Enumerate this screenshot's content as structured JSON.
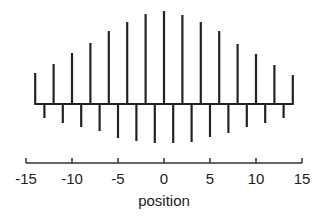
{
  "chart_data": {
    "type": "bar",
    "title": "",
    "xlabel": "position",
    "ylabel": "",
    "xlim": [
      -15,
      15
    ],
    "xticks": [
      -15,
      -10,
      -5,
      0,
      5,
      10,
      15
    ],
    "xtick_labels": [
      "-15",
      "-10",
      "-5",
      "0",
      "5",
      "10",
      "15"
    ],
    "grid": false,
    "series": [
      {
        "name": "upward",
        "x": [
          -14,
          -12,
          -10,
          -8,
          -6,
          -4,
          -2,
          0,
          2,
          4,
          6,
          8,
          10,
          12,
          14
        ],
        "values": [
          31,
          40,
          51,
          61,
          73,
          82,
          90,
          93,
          89,
          82,
          73,
          60,
          50,
          39,
          29
        ]
      },
      {
        "name": "downward",
        "x": [
          -13,
          -11,
          -9,
          -7,
          -5,
          -3,
          -1,
          1,
          3,
          5,
          7,
          9,
          11,
          13
        ],
        "values": [
          -14,
          -19,
          -23,
          -27,
          -34,
          -37,
          -39,
          -39,
          -38,
          -33,
          -29,
          -23,
          -19,
          -14
        ]
      }
    ]
  }
}
